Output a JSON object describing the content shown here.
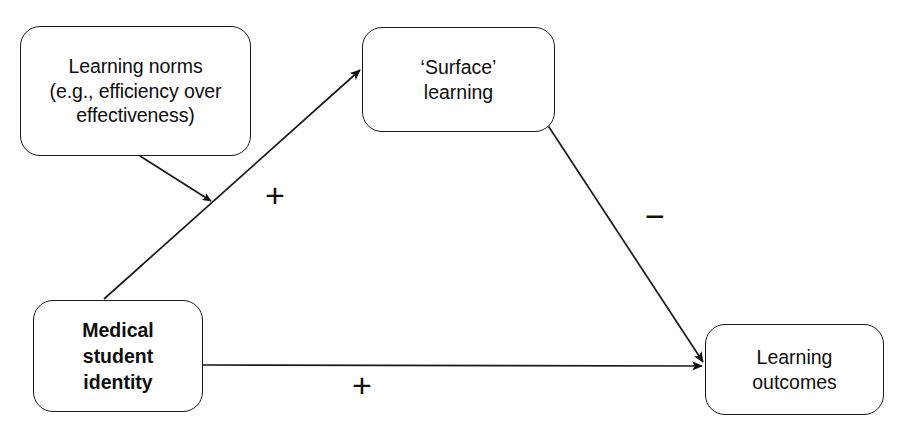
{
  "diagram": {
    "title": "",
    "background_color": "#ffffff",
    "stroke_color": "#1a1a1a",
    "text_color": "#0d0d0d",
    "nodes": [
      {
        "id": "learning-norms",
        "label": "Learning norms\n(e.g., efficiency over\neffectiveness)",
        "shape": "rounded-rectangle",
        "bold": false
      },
      {
        "id": "surface-learning",
        "label": "‘Surface’\nlearning",
        "shape": "rounded-rectangle",
        "bold": false
      },
      {
        "id": "medical-student-identity",
        "label": "Medical\nstudent\nidentity",
        "shape": "rounded-rectangle",
        "bold": true
      },
      {
        "id": "learning-outcomes",
        "label": "Learning\noutcomes",
        "shape": "rounded-rectangle",
        "bold": false
      }
    ],
    "edges": [
      {
        "id": "identity-to-surface",
        "from": "medical-student-identity",
        "to": "surface-learning",
        "sign_label": "+",
        "arrowhead": "filled-triangle"
      },
      {
        "id": "norms-to-path",
        "from": "learning-norms",
        "to": "identity-to-surface",
        "sign_label": "",
        "arrowhead": "filled-triangle"
      },
      {
        "id": "surface-to-outcomes",
        "from": "surface-learning",
        "to": "learning-outcomes",
        "sign_label": "−",
        "arrowhead": "filled-triangle"
      },
      {
        "id": "identity-to-outcomes",
        "from": "medical-student-identity",
        "to": "learning-outcomes",
        "sign_label": "+",
        "arrowhead": "filled-triangle"
      }
    ],
    "signs": {
      "plus_upper": "+",
      "minus": "−",
      "plus_lower": "+"
    }
  }
}
